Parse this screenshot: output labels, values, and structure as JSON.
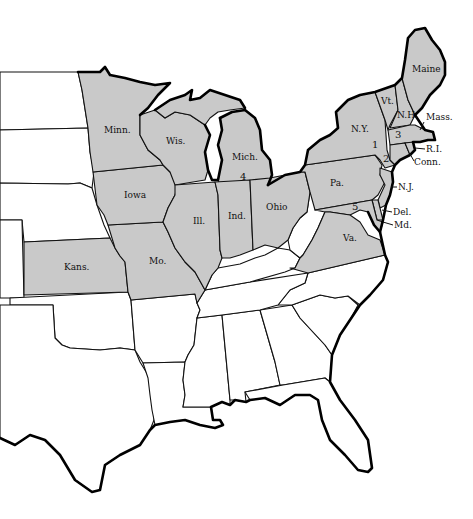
{
  "map": {
    "type": "US states map (eastern half)",
    "shaded_color": "#c9c9c9",
    "unshaded_color": "#ffffff",
    "border_color": "#111111",
    "shaded_states": [
      {
        "abbr": "Maine"
      },
      {
        "abbr": "Vt."
      },
      {
        "abbr": "N.H."
      },
      {
        "abbr": "Mass."
      },
      {
        "abbr": "R.I."
      },
      {
        "abbr": "Conn."
      },
      {
        "abbr": "N.Y."
      },
      {
        "abbr": "N.J."
      },
      {
        "abbr": "Pa."
      },
      {
        "abbr": "Del."
      },
      {
        "abbr": "Md."
      },
      {
        "abbr": "Va."
      },
      {
        "abbr": "Ohio"
      },
      {
        "abbr": "Ind."
      },
      {
        "abbr": "Ill."
      },
      {
        "abbr": "Mich."
      },
      {
        "abbr": "Wis."
      },
      {
        "abbr": "Minn."
      },
      {
        "abbr": "Iowa"
      },
      {
        "abbr": "Mo."
      },
      {
        "abbr": "Kans."
      }
    ],
    "labels": {
      "maine": "Maine",
      "vt": "Vt.",
      "nh": "N.H.",
      "mass": "Mass.",
      "ri": "R.I.",
      "conn": "Conn.",
      "ny": "N.Y.",
      "nj": "N.J.",
      "pa": "Pa.",
      "del": "Del.",
      "md": "Md.",
      "va": "Va.",
      "ohio": "Ohio",
      "ind": "Ind.",
      "ill": "Ill.",
      "mich": "Mich.",
      "wis": "Wis.",
      "minn": "Minn.",
      "iowa": "Iowa",
      "mo": "Mo.",
      "kans": "Kans."
    },
    "numbers": {
      "n1": "1",
      "n2": "2",
      "n3": "3",
      "n4": "4",
      "n5": "5"
    }
  }
}
